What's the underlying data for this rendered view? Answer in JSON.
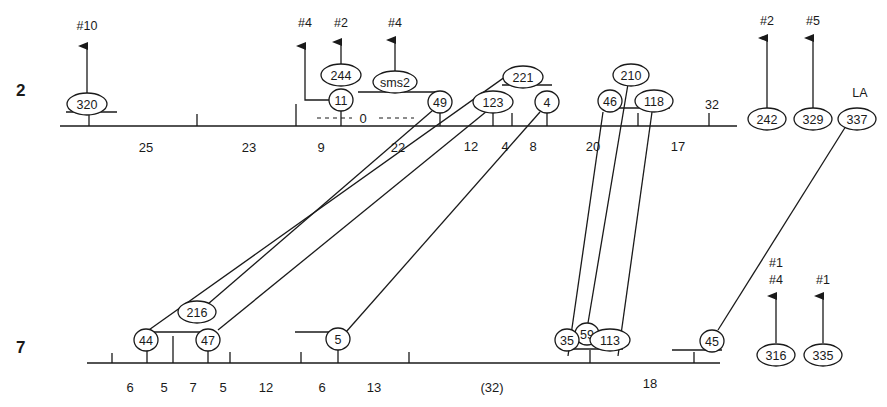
{
  "chromosomes": {
    "top": {
      "label": "2"
    },
    "bottom": {
      "label": "7"
    }
  },
  "top_segments": [
    "25",
    "23",
    "9",
    "22",
    "12",
    "4",
    "8",
    "20",
    "17"
  ],
  "bottom_segments": [
    "6",
    "5",
    "7",
    "5",
    "12",
    "6",
    "13",
    "(32)",
    "18"
  ],
  "top_markers": {
    "m320": "320",
    "m11": "11",
    "m244": "244",
    "msms2": "sms2",
    "m49": "49",
    "m221": "221",
    "m123": "123",
    "m4": "4",
    "m210": "210",
    "m46": "46",
    "m118": "118",
    "m32": "32",
    "m242": "242",
    "m329": "329",
    "m337": "337"
  },
  "bottom_markers": {
    "m44": "44",
    "m216": "216",
    "m47": "47",
    "m5": "5",
    "m59": "59",
    "m35": "35",
    "m113": "113",
    "m45": "45",
    "m316": "316",
    "m335": "335"
  },
  "annotations": {
    "zero_gap": "0",
    "la": "LA",
    "dest_320": "#10",
    "dest_11": "#4",
    "dest_244": "#2",
    "dest_sms2": "#4",
    "dest_242": "#2",
    "dest_329": "#5",
    "dest_316_a": "#1",
    "dest_316_b": "#4",
    "dest_335": "#1"
  },
  "connections": [
    {
      "from": "221",
      "to": "44"
    },
    {
      "from": "49",
      "to": "216"
    },
    {
      "from": "123",
      "to": "47"
    },
    {
      "from": "4",
      "to": "5"
    },
    {
      "from": "46",
      "to": "35"
    },
    {
      "from": "210",
      "to": "59"
    },
    {
      "from": "118",
      "to": "113"
    },
    {
      "from": "337",
      "to": "45"
    }
  ]
}
